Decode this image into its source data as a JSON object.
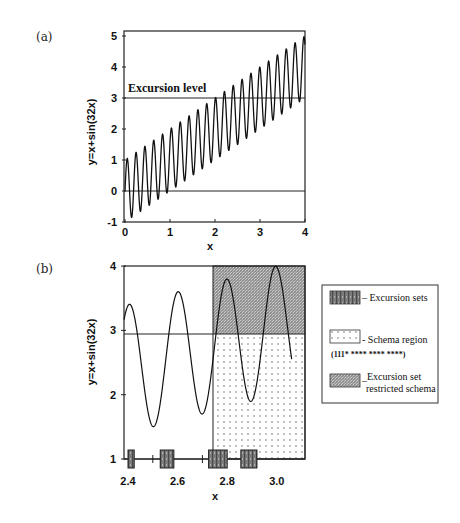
{
  "chart_data": [
    {
      "type": "line",
      "panel_label": "(a)",
      "title": "",
      "function": "y = x + sin(32x)",
      "xlabel": "x",
      "ylabel": "y=x+sin(32x)",
      "xlim": [
        0,
        4
      ],
      "ylim": [
        -1,
        5
      ],
      "xticks": [
        "0",
        "1",
        "2",
        "3",
        "4"
      ],
      "yticks": [
        "-1",
        "0",
        "1",
        "2",
        "3",
        "4",
        "5"
      ],
      "grid": false,
      "hlines": [
        {
          "y": 3,
          "label": "Excursion level"
        },
        {
          "y": 0,
          "label": ""
        }
      ],
      "annotations": [
        "Excursion level"
      ]
    },
    {
      "type": "line",
      "panel_label": "(b)",
      "function": "y = x + sin(32x)",
      "xlabel": "x",
      "ylabel": "y=x+sin(32x)",
      "xlim": [
        2.4,
        3.06
      ],
      "ylim": [
        1,
        4
      ],
      "xticks": [
        "2.4",
        "2.6",
        "2.8",
        "3.0"
      ],
      "yticks": [
        "1",
        "2",
        "3",
        "4"
      ],
      "grid": false,
      "hlines": [
        {
          "y": 3
        }
      ],
      "regions": [
        {
          "name": "Schema region",
          "x": [
            2.75,
            3.06
          ],
          "y": [
            1,
            3
          ],
          "pattern": "dots"
        },
        {
          "name": "Excursion set restricted schema",
          "x": [
            2.75,
            3.06
          ],
          "y": [
            3,
            4
          ],
          "pattern": "dense-hatch"
        }
      ],
      "excursion_sets_x": [
        [
          2.4,
          2.425
        ],
        [
          2.53,
          2.585
        ],
        [
          2.725,
          2.8
        ],
        [
          2.855,
          2.92
        ]
      ],
      "legend": {
        "position": "right",
        "entries": [
          {
            "label": "Excursion sets",
            "pattern": "vertical-bars"
          },
          {
            "label": "Schema region",
            "sublabel": "(111* **** **** ****)",
            "pattern": "dots"
          },
          {
            "label": "Excursion set restricted schema",
            "pattern": "dense-hatch"
          }
        ]
      }
    }
  ],
  "panel_a": {
    "label": "(a)",
    "ylabel": "y=x+sin(32x)",
    "xlabel": "x",
    "annotation": "Excursion level",
    "xticks": [
      "0",
      "1",
      "2",
      "3",
      "4"
    ],
    "yticks": [
      "-1",
      "0",
      "1",
      "2",
      "3",
      "4",
      "5"
    ]
  },
  "panel_b": {
    "label": "(b)",
    "ylabel": "y=x+sin(32x)",
    "xlabel": "x",
    "xticks": [
      "2.4",
      "2.6",
      "2.8",
      "3.0"
    ],
    "yticks": [
      "1",
      "2",
      "3",
      "4"
    ]
  },
  "legend": {
    "excursion_sets": "Excursion sets",
    "schema_region": "Schema region",
    "schema_string": "(111* **** **** ****)",
    "restricted_line1": "Excursion set",
    "restricted_line2": "restricted schema"
  }
}
